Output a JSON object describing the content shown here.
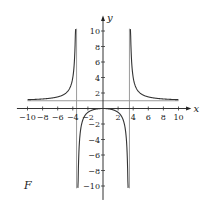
{
  "chart_data": {
    "type": "line",
    "title": "",
    "panel_label": "F",
    "xlabel": "x",
    "ylabel": "y",
    "xlim": [
      -10,
      10
    ],
    "ylim": [
      -10,
      10
    ],
    "grid": false,
    "x_ticks": [
      -10,
      -8,
      -6,
      -4,
      -2,
      2,
      4,
      6,
      8,
      10
    ],
    "x_tick_labels": [
      "−10",
      "−8",
      "−6",
      "−4",
      "−2",
      "2",
      "4",
      "6",
      "8",
      "10"
    ],
    "y_ticks": [
      -10,
      -8,
      -6,
      -4,
      -2,
      2,
      4,
      6,
      8,
      10
    ],
    "y_tick_labels": [
      "−10",
      "−8",
      "−6",
      "−4",
      "−2",
      "2",
      "4",
      "6",
      "8",
      "10"
    ],
    "asymptotes": {
      "vertical": [
        -3.5,
        3.5
      ],
      "horizontal": [
        1
      ]
    },
    "series": [
      {
        "name": "left branch",
        "x": [
          -10,
          -9,
          -8,
          -7,
          -6,
          -5,
          -4.5,
          -4,
          -3.8,
          -3.7,
          -3.6
        ],
        "y": [
          1.14,
          1.17,
          1.23,
          1.32,
          1.5,
          1.92,
          2.45,
          4.0,
          6.0,
          8.0,
          10.0
        ]
      },
      {
        "name": "middle branch",
        "x": [
          -3.35,
          -3.2,
          -3,
          -2.5,
          -2,
          -1,
          0,
          1,
          2,
          2.5,
          3,
          3.2,
          3.35
        ],
        "y": [
          -10,
          -5.7,
          -3.0,
          -1.09,
          -0.5,
          -0.09,
          0,
          -0.09,
          -0.5,
          -1.09,
          -3.0,
          -5.7,
          -10
        ]
      },
      {
        "name": "right branch",
        "x": [
          3.6,
          3.7,
          3.8,
          4,
          4.5,
          5,
          6,
          7,
          8,
          9,
          10
        ],
        "y": [
          10.0,
          8.0,
          6.0,
          4.0,
          2.45,
          1.92,
          1.5,
          1.32,
          1.23,
          1.17,
          1.14
        ]
      }
    ]
  }
}
